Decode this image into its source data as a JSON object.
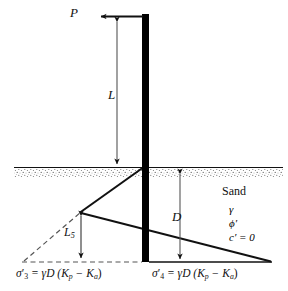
{
  "figure": {
    "type": "engineering-diagram",
    "background_color": "#ffffff",
    "line_color": "#111111",
    "wall_color": "#000000"
  },
  "labels": {
    "load_P": "P",
    "length_L": "L",
    "depth_D": "D",
    "length_L5": "L",
    "length_L5_sub": "5",
    "soil_name": "Sand",
    "unit_weight": "γ",
    "friction_angle": "ϕ′",
    "cohesion": "c′ = 0"
  },
  "pressure_labels": {
    "left": {
      "symbol": "σ",
      "sub": "3",
      "prime": "′",
      "equation": "= γD (K",
      "sub_p": "p",
      "minus": "− K",
      "sub_a": "a",
      "close": ")",
      "full_text": "σ′₃ = γD (Kₚ − Kₐ)"
    },
    "right": {
      "symbol": "σ",
      "sub": "4",
      "prime": "′",
      "equation": "= γD (K",
      "sub_p": "p",
      "minus": "− K",
      "sub_a": "a",
      "close": ")",
      "full_text": "σ′₄ = γD (Kₚ − Kₐ)"
    }
  },
  "geometry": {
    "wall_x_left": 142,
    "wall_x_right": 149,
    "wall_top_y": 14,
    "wall_bottom_y": 262,
    "ground_line_y": 167,
    "baseline_y": 262,
    "apex_x": 81,
    "apex_y": 212,
    "left_dashed_end_x": 24,
    "right_tip_x": 270,
    "P_arrow_y": 16,
    "P_arrow_end_x": 100,
    "L_dim_x": 117,
    "L_dim_top_y": 20,
    "L_dim_bottom_y": 166,
    "D_dim_x": 180,
    "D_dim_top_y": 172,
    "D_dim_bottom_y": 261,
    "L5_dim_x": 81,
    "L5_dim_top_y": 214,
    "L5_dim_bottom_y": 260
  }
}
